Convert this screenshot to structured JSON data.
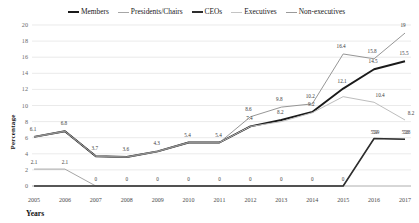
{
  "chart_data": {
    "type": "line",
    "title": "",
    "xlabel": "Years",
    "ylabel": "Percentage",
    "categories": [
      "2005",
      "2006",
      "2007",
      "2008",
      "2009",
      "2010",
      "2011",
      "2012",
      "2013",
      "2014",
      "2015",
      "2016",
      "2017"
    ],
    "ylim": [
      0,
      20
    ],
    "yticks": [
      0,
      2,
      4,
      6,
      8,
      10,
      12,
      14,
      16,
      18,
      20
    ],
    "grid": true,
    "legend_position": "top",
    "series": [
      {
        "name": "Members",
        "color": "#1a1a1a",
        "values": [
          6.1,
          6.8,
          3.7,
          3.6,
          4.3,
          5.4,
          5.4,
          7.4,
          8.2,
          9.2,
          12.1,
          14.5,
          15.5
        ],
        "labels": [
          "6.1",
          "6.8",
          "3.7",
          "3.6",
          "4.3",
          "5.4",
          "5.4",
          "7.4",
          "8.2",
          "9.2",
          "12.1",
          "14.5",
          "15.5"
        ]
      },
      {
        "name": "Presidents/Chairs",
        "color": "#a6a6a6",
        "values": [
          2.1,
          2.1,
          0,
          0,
          0,
          0,
          0,
          0,
          0,
          0,
          0,
          5.9,
          5.8
        ],
        "labels": [
          "2.1",
          "2.1",
          "0",
          "0",
          "0",
          "0",
          "0",
          "0",
          "0",
          "0",
          "0",
          "5.9",
          "5.8"
        ]
      },
      {
        "name": "CEOs",
        "color": "#2e2e2e",
        "values": [
          0,
          0,
          0,
          0,
          0,
          0,
          0,
          0,
          0,
          0,
          0,
          5.9,
          5.8
        ],
        "labels": [
          "",
          "",
          "",
          "",
          "",
          "",
          "",
          "",
          "",
          "",
          "",
          "5.9",
          "5.8"
        ]
      },
      {
        "name": "Executives",
        "color": "#bdbdbd",
        "values": [
          6.1,
          6.8,
          3.7,
          3.6,
          4.3,
          5.4,
          5.4,
          7.4,
          8.0,
          9.1,
          11.1,
          10.4,
          8.2
        ],
        "labels": [
          "",
          "",
          "",
          "",
          "",
          "",
          "",
          "",
          "",
          "",
          "",
          "10.4",
          "8.2"
        ]
      },
      {
        "name": "Non-executives",
        "color": "#8a8a8a",
        "values": [
          6.1,
          6.8,
          3.7,
          3.6,
          4.3,
          5.4,
          5.4,
          8.6,
          9.8,
          10.2,
          16.4,
          15.8,
          19.0
        ],
        "labels": [
          "",
          "",
          "",
          "",
          "",
          "",
          "",
          "8.6",
          "9.8",
          "10.2",
          "16.4",
          "15.8",
          "19"
        ]
      }
    ]
  },
  "legend": {
    "items": [
      {
        "label": "Members",
        "color": "#1a1a1a",
        "width": "2.2px"
      },
      {
        "label": "Presidents/Chairs",
        "color": "#a6a6a6",
        "width": "1.6px"
      },
      {
        "label": "CEOs",
        "color": "#2e2e2e",
        "width": "2.2px"
      },
      {
        "label": "Executives",
        "color": "#c4c4c4",
        "width": "1.2px"
      },
      {
        "label": "Non-executives",
        "color": "#9a9a9a",
        "width": "1.4px"
      }
    ]
  },
  "axes": {
    "y_title": "Percentage",
    "x_title": "Years"
  }
}
